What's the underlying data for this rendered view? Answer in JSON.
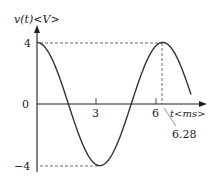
{
  "chart_data": {
    "type": "line",
    "title": "",
    "ylabel": "v(t)<V>",
    "xlabel": "t<ms>",
    "function": "v(t) = 4 cos(t)",
    "ylim": [
      -4,
      4
    ],
    "xlim": [
      0,
      7.7
    ],
    "yticks": [
      "4",
      "0",
      "-4"
    ],
    "xticks": [
      "3",
      "6"
    ],
    "annotations": [
      {
        "label": "6.28",
        "x": 6.28,
        "note": "peak at t = 2π"
      }
    ],
    "x": [
      0,
      0.5,
      1,
      1.5,
      2,
      2.5,
      3,
      3.14,
      3.5,
      4,
      4.5,
      5,
      5.5,
      6,
      6.28,
      6.5,
      7,
      7.5,
      7.85
    ],
    "series": [
      {
        "name": "v(t)",
        "values": [
          4,
          3.51,
          2.16,
          0.28,
          -1.66,
          -3.2,
          -3.96,
          -4,
          -3.75,
          -2.61,
          -0.84,
          1.13,
          2.84,
          3.84,
          4,
          3.9,
          3.02,
          1.39,
          0
        ]
      }
    ],
    "grid": false,
    "guides": "dashed lines at v=4, v=-4 and t=6.28"
  },
  "labels": {
    "y_axis": "v(t)<V>",
    "x_axis": "t<ms>",
    "y4": "4",
    "y0": "0",
    "yneg4": "−4",
    "x3": "3",
    "x6": "6",
    "x628": "6.28"
  }
}
